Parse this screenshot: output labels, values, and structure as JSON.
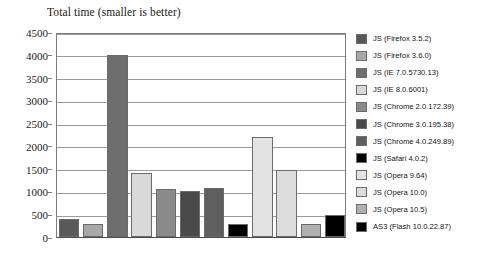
{
  "chart_data": {
    "type": "bar",
    "title": "Total time (smaller is better)",
    "xlabel": "",
    "ylabel": "",
    "ylim": [
      0,
      4500
    ],
    "ytick_step": 500,
    "yticks": [
      "0",
      "500",
      "1000",
      "1500",
      "2000",
      "2500",
      "3000",
      "3500",
      "4000",
      "4500"
    ],
    "grid": true,
    "legend_position": "right",
    "categories": [
      "JS (Firefox 3.5.2)",
      "JS (Firefox 3.6.0)",
      "JS (IE 7.0.5730.13)",
      "JS (IE 8.0.6001)",
      "JS (Chrome 2.0.172.39)",
      "JS (Chrome 3.0.195.38)",
      "JS (Chrome 4.0.249.89)",
      "JS (Safari 4.0.2)",
      "JS (Opera 9.64)",
      "JS (Opera 10.0)",
      "JS (Opera 10.5)",
      "AS3 (Flash 10.0.22.87)"
    ],
    "values": [
      400,
      280,
      4000,
      1400,
      1050,
      1010,
      1080,
      280,
      2200,
      1470,
      280,
      480
    ],
    "colors": [
      "#595959",
      "#a8a8a8",
      "#6e6e6e",
      "#d9d9d9",
      "#8a8a8a",
      "#4a4a4a",
      "#5f5f5f",
      "#000000",
      "#e3e3e3",
      "#dcdcdc",
      "#b0b0b0",
      "#000000"
    ]
  },
  "legend": {
    "items": [
      {
        "label": "JS (Firefox 3.5.2)",
        "color": "#595959"
      },
      {
        "label": "JS (Firefox 3.6.0)",
        "color": "#a8a8a8"
      },
      {
        "label": "JS (IE 7.0.5730.13)",
        "color": "#6e6e6e"
      },
      {
        "label": "JS (IE 8.0.6001)",
        "color": "#d9d9d9"
      },
      {
        "label": "JS (Chrome 2.0.172.39)",
        "color": "#8a8a8a"
      },
      {
        "label": "JS (Chrome 3.0.195.38)",
        "color": "#4a4a4a"
      },
      {
        "label": "JS (Chrome 4.0.249.89)",
        "color": "#5f5f5f"
      },
      {
        "label": "JS (Safari 4.0.2)",
        "color": "#000000"
      },
      {
        "label": "JS (Opera 9.64)",
        "color": "#e3e3e3"
      },
      {
        "label": "JS (Opera 10.0)",
        "color": "#dcdcdc"
      },
      {
        "label": "JS (Opera 10.5)",
        "color": "#b0b0b0"
      },
      {
        "label": "AS3 (Flash 10.0.22.87)",
        "color": "#000000"
      }
    ]
  }
}
